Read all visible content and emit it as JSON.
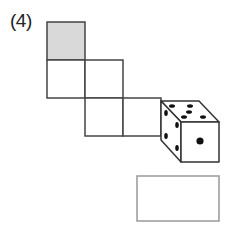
{
  "problem": {
    "number_label": "(4)",
    "description": "Net of a cube with shaded square; die shown; empty answer box"
  },
  "net": {
    "cell_size": 38,
    "cells": [
      {
        "col": 0,
        "row": 0,
        "shaded": true
      },
      {
        "col": 0,
        "row": 1,
        "shaded": false
      },
      {
        "col": 1,
        "row": 1,
        "shaded": false
      },
      {
        "col": 1,
        "row": 2,
        "shaded": false
      },
      {
        "col": 2,
        "row": 2,
        "shaded": false
      }
    ],
    "shade_color": "#d9d9d9",
    "line_color": "#444444"
  },
  "die": {
    "front_face_pips": 1,
    "top_face_pips": 5,
    "side_face_pips": 4
  },
  "answer_box": {
    "value": ""
  }
}
